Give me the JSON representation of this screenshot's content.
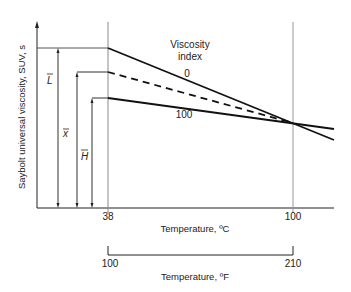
{
  "diagram": {
    "y_axis_label": "Saybolt universal viscosity, SUV, s",
    "x_axis_label_c": "Temperature, ºC",
    "x_axis_label_f": "Temperature, ºF",
    "celsius_ticks": [
      "38",
      "100"
    ],
    "fahrenheit_ticks": [
      "100",
      "210"
    ],
    "legend_title_line1": "Viscosity",
    "legend_title_line2": "index",
    "series_labels": {
      "vi_0": "0",
      "vi_100": "100"
    },
    "reference_labels": {
      "L": "L",
      "x": "x",
      "H": "H"
    },
    "lines": [
      {
        "name": "VI 0 (L)",
        "style": "solid",
        "start_y_at_38C": "high",
        "crosses_at_100C": true
      },
      {
        "name": "Sample (x)",
        "style": "dashed",
        "start_y_at_38C": "middle",
        "crosses_at_100C": true
      },
      {
        "name": "VI 100 (H)",
        "style": "solid",
        "start_y_at_38C": "low",
        "crosses_at_100C": true
      }
    ]
  }
}
